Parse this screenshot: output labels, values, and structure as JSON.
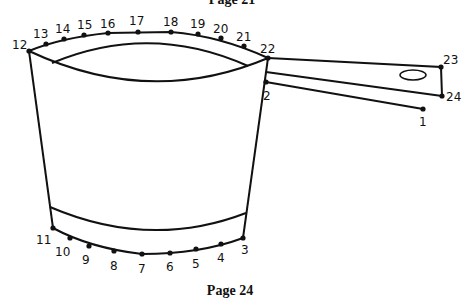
{
  "header": {
    "page_label": "Page 21"
  },
  "footer": {
    "page_label": "Page 24"
  },
  "puzzle": {
    "title": "Connect the dots — cooking pot",
    "dots": [
      {
        "n": "1",
        "x": 423,
        "y": 109,
        "lx": 419,
        "ly": 126
      },
      {
        "n": "2",
        "x": 266,
        "y": 82,
        "lx": 263,
        "ly": 100
      },
      {
        "n": "3",
        "x": 243,
        "y": 238,
        "lx": 241,
        "ly": 254
      },
      {
        "n": "4",
        "x": 221,
        "y": 244,
        "lx": 217,
        "ly": 262
      },
      {
        "n": "5",
        "x": 196,
        "y": 249,
        "lx": 192,
        "ly": 268
      },
      {
        "n": "6",
        "x": 170,
        "y": 253,
        "lx": 166,
        "ly": 271
      },
      {
        "n": "7",
        "x": 142,
        "y": 254,
        "lx": 138,
        "ly": 273
      },
      {
        "n": "8",
        "x": 114,
        "y": 251,
        "lx": 110,
        "ly": 270
      },
      {
        "n": "9",
        "x": 89,
        "y": 246,
        "lx": 82,
        "ly": 264
      },
      {
        "n": "10",
        "x": 70,
        "y": 238,
        "lx": 55,
        "ly": 256
      },
      {
        "n": "11",
        "x": 53,
        "y": 228,
        "lx": 36,
        "ly": 244
      },
      {
        "n": "12",
        "x": 29,
        "y": 51,
        "lx": 12,
        "ly": 49
      },
      {
        "n": "13",
        "x": 46,
        "y": 44,
        "lx": 33,
        "ly": 38
      },
      {
        "n": "14",
        "x": 64,
        "y": 39,
        "lx": 55,
        "ly": 33
      },
      {
        "n": "15",
        "x": 84,
        "y": 35,
        "lx": 77,
        "ly": 29
      },
      {
        "n": "16",
        "x": 108,
        "y": 33,
        "lx": 100,
        "ly": 28
      },
      {
        "n": "17",
        "x": 138,
        "y": 32,
        "lx": 129,
        "ly": 25
      },
      {
        "n": "18",
        "x": 171,
        "y": 32,
        "lx": 163,
        "ly": 26
      },
      {
        "n": "19",
        "x": 198,
        "y": 34,
        "lx": 190,
        "ly": 28
      },
      {
        "n": "20",
        "x": 221,
        "y": 38,
        "lx": 213,
        "ly": 33
      },
      {
        "n": "21",
        "x": 244,
        "y": 46,
        "lx": 236,
        "ly": 41
      },
      {
        "n": "22",
        "x": 268,
        "y": 58,
        "lx": 260,
        "ly": 53
      },
      {
        "n": "23",
        "x": 441,
        "y": 67,
        "lx": 443,
        "ly": 64
      },
      {
        "n": "24",
        "x": 442,
        "y": 96,
        "lx": 446,
        "ly": 101
      }
    ]
  }
}
